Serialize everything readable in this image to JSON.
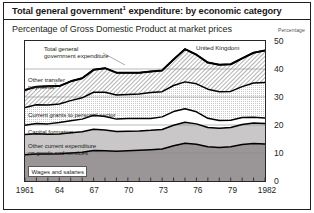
{
  "header": {
    "title_main": "Total general government",
    "title_sup": "1",
    "title_rest": " expenditure: by economic category",
    "subtitle": "Percentage of Gross Domestic Product at market prices",
    "axis_unit_label": "Percentage",
    "region_label": "United Kingdom"
  },
  "annotations": {
    "total_line": "Total general\ngovernment expenditure",
    "total_line_l1": "Total general",
    "total_line_l2": "government expenditure",
    "other_transfer_l1": "Other transfer",
    "other_transfer_l2": "payments",
    "other_transfer_sup": "2",
    "current_grants": "Current grants to personal sector",
    "capital_formation": "Capital formation",
    "other_current_l1": "Other current expenditure",
    "other_current_l2": "on goods and services",
    "wages": "Wages and salaries"
  },
  "colors": {
    "frame": "#231f20",
    "line": "#000000",
    "wages_fill": "#9a9698",
    "other_current_fill": "#c9c7c8",
    "capital_fill": "#ffffff",
    "current_grants_fill": "#e8e6e7",
    "other_transfer_fill": "#ffffff",
    "grid": "#8d8a8b"
  },
  "chart_data": {
    "type": "area",
    "subtitle": "Percentage of Gross Domestic Product at market prices",
    "region": "United Kingdom",
    "xlabel": "",
    "ylabel": "Percentage",
    "ylim": [
      0,
      50
    ],
    "yticks": [
      0,
      10,
      20,
      30,
      40,
      50
    ],
    "xlim": [
      1961,
      1982
    ],
    "xticks": [
      1961,
      1964,
      1967,
      1970,
      1973,
      1976,
      1979,
      1982
    ],
    "xticklabels": [
      "1961",
      "64",
      "67",
      "70",
      "73",
      "76",
      "79",
      "1982"
    ],
    "minor_xticks_every": 1,
    "grid": true,
    "legend": "inline-labels",
    "stacked": true,
    "x": [
      1961,
      1962,
      1963,
      1964,
      1965,
      1966,
      1967,
      1968,
      1969,
      1970,
      1971,
      1972,
      1973,
      1974,
      1975,
      1976,
      1977,
      1978,
      1979,
      1980,
      1981,
      1982
    ],
    "series": [
      {
        "name": "Wages and salaries",
        "fill": "#9a9698",
        "values": [
          9.4,
          9.6,
          9.6,
          9.7,
          10.0,
          10.3,
          10.9,
          10.8,
          10.6,
          10.8,
          11.0,
          11.2,
          11.4,
          12.6,
          13.5,
          13.1,
          12.2,
          12.0,
          12.2,
          13.0,
          13.4,
          13.2
        ]
      },
      {
        "name": "Other current expenditure on goods and services",
        "fill": "#c9c7c8",
        "values": [
          7.2,
          7.3,
          7.1,
          7.1,
          7.2,
          7.3,
          7.6,
          7.4,
          7.1,
          7.0,
          6.9,
          6.9,
          7.0,
          7.3,
          7.5,
          7.3,
          6.9,
          6.8,
          6.9,
          7.2,
          7.3,
          7.3
        ]
      },
      {
        "name": "Capital formation",
        "fill": "#ffffff",
        "values": [
          3.3,
          3.6,
          3.7,
          4.1,
          4.3,
          4.5,
          5.0,
          4.8,
          4.4,
          4.5,
          4.4,
          4.2,
          4.5,
          4.9,
          4.8,
          4.3,
          3.3,
          2.8,
          2.6,
          2.5,
          2.1,
          2.0
        ]
      },
      {
        "name": "Current grants to personal sector",
        "fill": "#e8e6e7",
        "values": [
          6.3,
          6.7,
          6.7,
          6.6,
          7.2,
          7.6,
          8.2,
          8.7,
          8.6,
          8.6,
          8.8,
          9.3,
          9.0,
          9.3,
          9.6,
          10.0,
          10.4,
          10.3,
          10.3,
          11.0,
          12.2,
          12.7
        ]
      },
      {
        "name": "Other transfer payments",
        "fill": "#ffffff",
        "values": [
          6.3,
          6.5,
          6.7,
          6.4,
          6.9,
          7.0,
          8.0,
          8.6,
          8.0,
          7.8,
          7.6,
          7.5,
          7.6,
          9.3,
          11.7,
          10.4,
          9.5,
          9.6,
          9.7,
          10.1,
          10.8,
          11.4
        ]
      }
    ],
    "total_line": {
      "name": "Total general government expenditure",
      "values": [
        32.5,
        33.7,
        33.8,
        33.9,
        35.6,
        36.7,
        39.7,
        40.3,
        38.7,
        38.7,
        38.7,
        39.1,
        39.5,
        43.4,
        47.1,
        45.1,
        42.3,
        41.5,
        41.7,
        43.8,
        45.8,
        46.6
      ]
    }
  }
}
